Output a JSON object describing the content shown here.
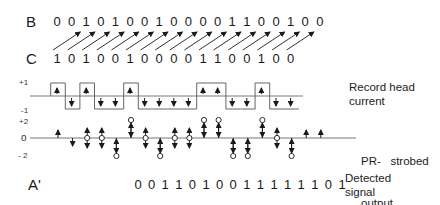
{
  "rows": {
    "B": {
      "label": "B",
      "bits": [
        0,
        0,
        1,
        0,
        1,
        0,
        0,
        1,
        0,
        0,
        0,
        0,
        1,
        1,
        0,
        0,
        1,
        0,
        0
      ]
    },
    "C": {
      "label": "C",
      "bits": [
        1,
        0,
        1,
        0,
        0,
        1,
        0,
        0,
        0,
        0,
        1,
        1,
        0,
        0,
        1,
        0,
        0
      ]
    },
    "A_prime": {
      "label": "A'",
      "bits": [
        0,
        0,
        1,
        1,
        0,
        1,
        0,
        0,
        1,
        1,
        1,
        1,
        1,
        1,
        0,
        1
      ]
    }
  },
  "record_head": {
    "label_line1": "Record head",
    "label_line2": "current",
    "axis_plus": "+1",
    "axis_minus": "-1",
    "levels": [
      1,
      -1,
      1,
      -1,
      -1,
      1,
      -1,
      -1,
      -1,
      -1,
      1,
      1,
      -1,
      -1,
      1,
      -1,
      -1
    ]
  },
  "pr_output": {
    "label_line1": "PR-   strobed",
    "label_line2": "output",
    "axis_plus": "+2",
    "axis_zero": "o",
    "axis_minus": "- 2",
    "samples": [
      {
        "type": "up"
      },
      {
        "type": "down"
      },
      {
        "type": "zero"
      },
      {
        "type": "zero"
      },
      {
        "type": "minus2"
      },
      {
        "type": "plus2"
      },
      {
        "type": "zero"
      },
      {
        "type": "minus2"
      },
      {
        "type": "zero"
      },
      {
        "type": "zero"
      },
      {
        "type": "plus2"
      },
      {
        "type": "plus2"
      },
      {
        "type": "minus2"
      },
      {
        "type": "minus2"
      },
      {
        "type": "plus2"
      },
      {
        "type": "zero"
      },
      {
        "type": "minus2"
      },
      {
        "type": "up"
      },
      {
        "type": "up"
      }
    ]
  },
  "detected": {
    "label_line1": "Detected",
    "label_line2": "signal"
  },
  "colors": {
    "ink": "#1a1a1a",
    "line": "#555555"
  }
}
